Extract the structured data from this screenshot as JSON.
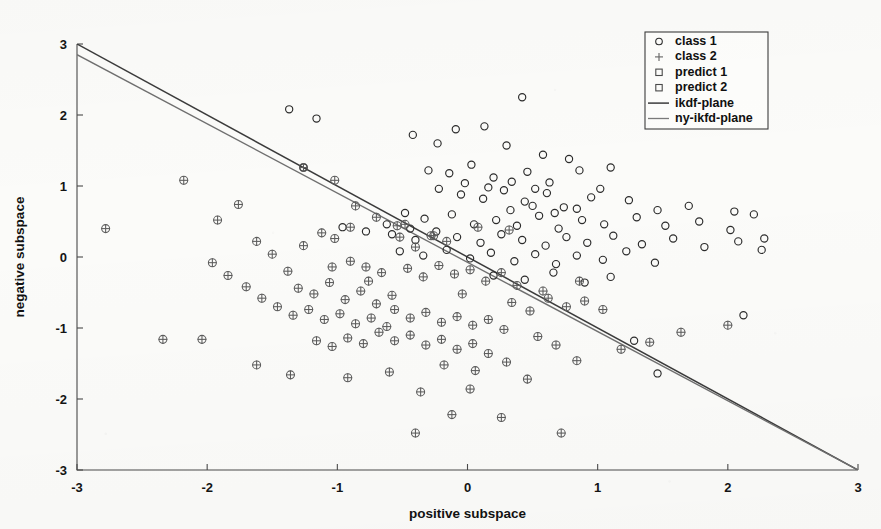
{
  "chart_data": {
    "type": "scatter",
    "title": "",
    "xlabel": "positive subspace",
    "ylabel": "negative subspace",
    "xlim": [
      -3,
      3
    ],
    "ylim": [
      -3,
      3
    ],
    "xticks": [
      -3,
      -2,
      -1,
      0,
      1,
      2,
      3
    ],
    "yticks": [
      -3,
      -2,
      -1,
      0,
      1,
      2,
      3
    ],
    "xticklabels": [
      "-3",
      "-2",
      "-1",
      "0",
      "1",
      "2",
      "3"
    ],
    "yticklabels": [
      "-3",
      "-2",
      "-1",
      "0",
      "1",
      "2",
      "3"
    ],
    "grid": false,
    "legend_position": "upper right",
    "legend_entries": [
      {
        "label": "class 1",
        "marker": "circle"
      },
      {
        "label": "class 2",
        "marker": "plus"
      },
      {
        "label": "predict 1",
        "marker": "square"
      },
      {
        "label": "predict 2",
        "marker": "square"
      },
      {
        "label": "ikdf-plane",
        "marker": "line"
      },
      {
        "label": "ny-ikfd-plane",
        "marker": "line"
      }
    ],
    "series": [
      {
        "name": "class 1",
        "marker": "circle",
        "color": "#2b2b2b",
        "points": [
          [
            -1.37,
            2.08
          ],
          [
            -1.16,
            1.95
          ],
          [
            -1.26,
            1.26
          ],
          [
            -0.42,
            1.72
          ],
          [
            -0.23,
            1.6
          ],
          [
            -0.09,
            1.8
          ],
          [
            0.13,
            1.84
          ],
          [
            0.42,
            2.25
          ],
          [
            0.3,
            1.57
          ],
          [
            0.58,
            1.44
          ],
          [
            0.78,
            1.38
          ],
          [
            1.1,
            1.26
          ],
          [
            -0.3,
            1.22
          ],
          [
            -0.14,
            1.18
          ],
          [
            0.03,
            1.3
          ],
          [
            0.2,
            1.12
          ],
          [
            0.46,
            1.2
          ],
          [
            0.63,
            1.05
          ],
          [
            0.86,
            1.22
          ],
          [
            1.02,
            0.96
          ],
          [
            -0.22,
            0.96
          ],
          [
            -0.05,
            0.88
          ],
          [
            0.12,
            0.82
          ],
          [
            0.28,
            0.94
          ],
          [
            0.44,
            0.78
          ],
          [
            0.61,
            0.9
          ],
          [
            0.74,
            0.7
          ],
          [
            0.95,
            0.84
          ],
          [
            1.24,
            0.8
          ],
          [
            1.46,
            0.66
          ],
          [
            1.7,
            0.72
          ],
          [
            2.05,
            0.64
          ],
          [
            -0.48,
            0.62
          ],
          [
            -0.33,
            0.54
          ],
          [
            -0.12,
            0.6
          ],
          [
            0.05,
            0.46
          ],
          [
            0.22,
            0.52
          ],
          [
            0.38,
            0.44
          ],
          [
            0.55,
            0.58
          ],
          [
            0.7,
            0.4
          ],
          [
            0.88,
            0.52
          ],
          [
            1.05,
            0.46
          ],
          [
            1.3,
            0.56
          ],
          [
            1.52,
            0.44
          ],
          [
            1.78,
            0.5
          ],
          [
            2.02,
            0.38
          ],
          [
            2.2,
            0.6
          ],
          [
            2.28,
            0.26
          ],
          [
            -0.58,
            0.32
          ],
          [
            -0.4,
            0.24
          ],
          [
            -0.24,
            0.36
          ],
          [
            -0.08,
            0.28
          ],
          [
            0.1,
            0.2
          ],
          [
            0.26,
            0.32
          ],
          [
            0.42,
            0.24
          ],
          [
            0.6,
            0.16
          ],
          [
            0.76,
            0.28
          ],
          [
            0.92,
            0.2
          ],
          [
            1.12,
            0.3
          ],
          [
            1.34,
            0.18
          ],
          [
            1.58,
            0.26
          ],
          [
            1.82,
            0.14
          ],
          [
            2.08,
            0.22
          ],
          [
            2.26,
            0.1
          ],
          [
            -0.52,
            0.08
          ],
          [
            -0.34,
            0.02
          ],
          [
            -0.16,
            0.1
          ],
          [
            0.02,
            -0.02
          ],
          [
            0.18,
            0.06
          ],
          [
            0.36,
            -0.06
          ],
          [
            0.52,
            0.04
          ],
          [
            0.68,
            -0.1
          ],
          [
            0.84,
            0.02
          ],
          [
            1.04,
            -0.04
          ],
          [
            1.22,
            0.08
          ],
          [
            1.44,
            -0.08
          ],
          [
            0.2,
            -0.26
          ],
          [
            0.44,
            -0.32
          ],
          [
            0.66,
            -0.22
          ],
          [
            0.9,
            -0.36
          ],
          [
            1.1,
            -0.28
          ],
          [
            1.28,
            -1.18
          ],
          [
            1.46,
            -1.64
          ],
          [
            2.12,
            -0.82
          ],
          [
            -0.96,
            0.42
          ],
          [
            -0.78,
            0.36
          ],
          [
            -0.62,
            0.46
          ],
          [
            -0.44,
            0.4
          ],
          [
            0.33,
            0.66
          ],
          [
            0.5,
            0.72
          ],
          [
            0.67,
            0.62
          ],
          [
            0.84,
            0.68
          ],
          [
            -0.02,
            1.04
          ],
          [
            0.16,
            0.98
          ],
          [
            0.34,
            1.06
          ],
          [
            0.52,
            0.96
          ]
        ]
      },
      {
        "name": "class 2",
        "marker": "circle-plus",
        "color": "#5c5c5c",
        "points": [
          [
            -2.78,
            0.4
          ],
          [
            -2.18,
            1.08
          ],
          [
            -2.34,
            -1.16
          ],
          [
            -2.04,
            -1.16
          ],
          [
            -1.92,
            0.52
          ],
          [
            -1.76,
            0.74
          ],
          [
            -1.62,
            0.22
          ],
          [
            -1.5,
            0.04
          ],
          [
            -1.38,
            -0.2
          ],
          [
            -1.26,
            0.16
          ],
          [
            -1.12,
            0.34
          ],
          [
            -1.02,
            0.26
          ],
          [
            -0.9,
            0.42
          ],
          [
            -1.3,
            -0.44
          ],
          [
            -1.18,
            -0.52
          ],
          [
            -1.06,
            -0.36
          ],
          [
            -0.94,
            -0.6
          ],
          [
            -0.82,
            -0.48
          ],
          [
            -0.7,
            -0.66
          ],
          [
            -0.58,
            -0.54
          ],
          [
            -1.46,
            -0.7
          ],
          [
            -1.34,
            -0.82
          ],
          [
            -1.22,
            -0.74
          ],
          [
            -1.1,
            -0.88
          ],
          [
            -0.98,
            -0.8
          ],
          [
            -0.86,
            -0.94
          ],
          [
            -0.74,
            -0.86
          ],
          [
            -0.62,
            -0.98
          ],
          [
            -1.58,
            -0.58
          ],
          [
            -1.7,
            -0.42
          ],
          [
            -1.84,
            -0.26
          ],
          [
            -1.96,
            -0.08
          ],
          [
            -1.02,
            1.08
          ],
          [
            -0.86,
            0.72
          ],
          [
            -0.7,
            0.56
          ],
          [
            -0.54,
            0.44
          ],
          [
            -0.52,
            0.28
          ],
          [
            -0.4,
            0.14
          ],
          [
            -0.28,
            0.3
          ],
          [
            -0.16,
            0.22
          ],
          [
            -0.46,
            -0.16
          ],
          [
            -0.34,
            -0.28
          ],
          [
            -0.22,
            -0.12
          ],
          [
            -0.1,
            -0.24
          ],
          [
            0.02,
            -0.18
          ],
          [
            0.14,
            -0.34
          ],
          [
            0.26,
            -0.22
          ],
          [
            0.38,
            -0.4
          ],
          [
            -0.66,
            -0.22
          ],
          [
            -0.78,
            -0.14
          ],
          [
            -0.9,
            -0.06
          ],
          [
            -1.04,
            -0.14
          ],
          [
            -0.56,
            -0.74
          ],
          [
            -0.44,
            -0.86
          ],
          [
            -0.32,
            -0.78
          ],
          [
            -0.2,
            -0.92
          ],
          [
            -0.08,
            -0.84
          ],
          [
            0.04,
            -0.96
          ],
          [
            0.16,
            -0.88
          ],
          [
            0.28,
            -1.02
          ],
          [
            -0.68,
            -1.06
          ],
          [
            -0.56,
            -1.18
          ],
          [
            -0.44,
            -1.1
          ],
          [
            -0.32,
            -1.24
          ],
          [
            -0.2,
            -1.16
          ],
          [
            -0.08,
            -1.3
          ],
          [
            0.04,
            -1.22
          ],
          [
            0.16,
            -1.36
          ],
          [
            -0.8,
            -1.22
          ],
          [
            -0.92,
            -1.14
          ],
          [
            -1.04,
            -1.26
          ],
          [
            -1.16,
            -1.18
          ],
          [
            0.34,
            -0.64
          ],
          [
            0.48,
            -0.76
          ],
          [
            0.62,
            -0.58
          ],
          [
            0.76,
            -0.7
          ],
          [
            0.9,
            -0.62
          ],
          [
            1.04,
            -0.74
          ],
          [
            0.54,
            -1.12
          ],
          [
            0.68,
            -1.24
          ],
          [
            -0.6,
            -1.62
          ],
          [
            -0.18,
            -1.52
          ],
          [
            0.06,
            -1.6
          ],
          [
            0.3,
            -1.48
          ],
          [
            -0.36,
            -1.9
          ],
          [
            0.02,
            -1.86
          ],
          [
            -0.12,
            -2.22
          ],
          [
            0.26,
            -2.26
          ],
          [
            -0.4,
            -2.48
          ],
          [
            0.72,
            -2.48
          ],
          [
            0.46,
            -1.72
          ],
          [
            0.84,
            -1.46
          ],
          [
            1.18,
            -1.3
          ],
          [
            1.4,
            -1.2
          ],
          [
            1.64,
            -1.06
          ],
          [
            2.0,
            -0.96
          ],
          [
            -1.62,
            -1.52
          ],
          [
            -1.36,
            -1.66
          ],
          [
            -0.92,
            -1.7
          ],
          [
            -0.76,
            -0.34
          ],
          [
            -1.26,
            1.26
          ],
          [
            -0.48,
            0.46
          ],
          [
            -0.26,
            0.3
          ],
          [
            0.08,
            0.42
          ],
          [
            0.32,
            0.38
          ],
          [
            0.58,
            -0.48
          ],
          [
            0.86,
            -0.34
          ],
          [
            -0.04,
            -0.52
          ]
        ]
      }
    ],
    "lines": [
      {
        "name": "ikdf-plane",
        "color": "#3b3b3b",
        "x": [
          -3,
          3
        ],
        "y": [
          3.0,
          -3.0
        ]
      },
      {
        "name": "ny-ikfd-plane",
        "color": "#7a7a7a",
        "x": [
          -3,
          3
        ],
        "y": [
          2.85,
          -3.0
        ]
      }
    ]
  }
}
